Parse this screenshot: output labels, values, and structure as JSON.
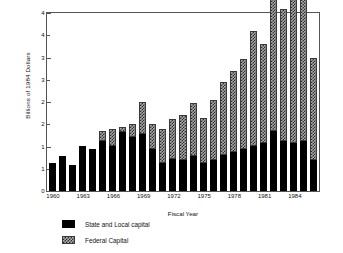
{
  "chart_data": {
    "type": "bar",
    "stacked": true,
    "title": "",
    "xlabel": "Fiscal Year",
    "ylabel": "Billions of 1984 Dollars",
    "ylim": [
      0,
      4
    ],
    "grid": false,
    "legend_position": "below-left",
    "y_major_ticks": [
      0,
      1,
      2,
      3,
      4
    ],
    "y_minor_ticks": [
      0.5,
      1.5,
      2.5,
      3.5
    ],
    "ytick_labels": [
      "0",
      "1",
      "1",
      "2",
      "2",
      "3",
      "3",
      "4",
      "4"
    ],
    "ytick_values": [
      0,
      0.5,
      1,
      1.5,
      2,
      2.5,
      3,
      3.5,
      4
    ],
    "xtick_labels": [
      "1960",
      "1963",
      "1966",
      "1969",
      "1972",
      "1975",
      "1978",
      "1981",
      "1984"
    ],
    "xtick_years": [
      1960,
      1963,
      1966,
      1969,
      1972,
      1975,
      1978,
      1981,
      1984
    ],
    "categories": [
      "1960",
      "1961",
      "1962",
      "1963",
      "1964",
      "1965",
      "1966",
      "1967",
      "1968",
      "1969",
      "1970",
      "1971",
      "1972",
      "1973",
      "1974",
      "1975",
      "1976",
      "1977",
      "1978",
      "1979",
      "1980",
      "1981",
      "1982",
      "1983",
      "1984",
      "1985",
      "1986"
    ],
    "series": [
      {
        "name": "State and Local capital",
        "color": "#000000",
        "pattern": "solid",
        "values": [
          0.62,
          0.78,
          0.58,
          1.02,
          0.95,
          1.12,
          1.02,
          1.32,
          1.22,
          1.28,
          0.95,
          0.62,
          0.72,
          0.7,
          0.78,
          0.62,
          0.7,
          0.82,
          0.88,
          0.95,
          1.02,
          1.08,
          1.35,
          1.12,
          1.08,
          1.12,
          0.7
        ]
      },
      {
        "name": "Federal Capital",
        "color": "#a8a8a8",
        "pattern": "checkered",
        "values": [
          0.0,
          0.0,
          0.0,
          0.0,
          0.0,
          0.22,
          0.38,
          0.12,
          0.28,
          0.72,
          0.55,
          0.78,
          0.9,
          1.0,
          1.2,
          1.02,
          1.35,
          1.62,
          1.82,
          2.02,
          2.58,
          2.22,
          3.25,
          2.98,
          3.45,
          3.65,
          2.3
        ]
      }
    ],
    "totals": [
      0.62,
      0.78,
      0.58,
      1.02,
      0.95,
      1.34,
      1.4,
      1.44,
      1.5,
      2.0,
      1.5,
      1.4,
      1.62,
      1.7,
      1.98,
      1.64,
      2.05,
      2.44,
      2.7,
      2.97,
      3.6,
      3.3,
      4.6,
      4.1,
      4.53,
      4.77,
      3.0
    ]
  },
  "legend": {
    "items": [
      {
        "label": "State and Local capital",
        "swatch": "solid-black"
      },
      {
        "label": "Federal Capital",
        "swatch": "checkered-gray"
      }
    ]
  }
}
